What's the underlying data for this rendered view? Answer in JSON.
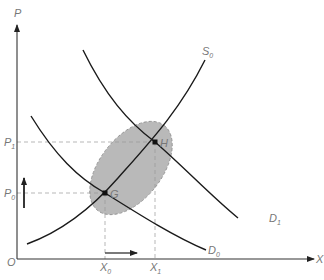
{
  "diagram": {
    "type": "supply-demand-shift",
    "axes": {
      "y_label": "P",
      "x_label": "X",
      "origin_label": "O"
    },
    "curves": {
      "supply": {
        "base": "S",
        "sub": "0"
      },
      "demand_new": {
        "base": "D",
        "sub": "1"
      },
      "demand_old": {
        "base": "D",
        "sub": "0"
      }
    },
    "points": {
      "initial": "G",
      "final": "H"
    },
    "price_levels": {
      "p0": {
        "base": "P",
        "sub": "0"
      },
      "p1": {
        "base": "P",
        "sub": "1"
      }
    },
    "quantity_levels": {
      "x0": {
        "base": "X",
        "sub": "0"
      },
      "x1": {
        "base": "X",
        "sub": "1"
      }
    },
    "arrows": {
      "price": "up",
      "quantity": "right"
    },
    "colors": {
      "curve": "#1a1a1a",
      "axis": "#333333",
      "ellipse_fill": "#b8b8b8",
      "ellipse_stroke": "#888888",
      "guide": "#999999",
      "label": "#777777"
    }
  }
}
